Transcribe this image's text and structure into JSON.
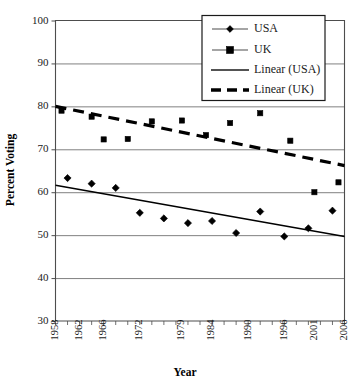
{
  "chart_data": {
    "type": "scatter",
    "title": "",
    "xlabel": "Year",
    "ylabel": "Percent Voting",
    "xlim": [
      1958,
      2006
    ],
    "ylim": [
      30,
      100
    ],
    "ytick_labels": [
      "30",
      "40",
      "50",
      "60",
      "70",
      "80",
      "90",
      "100"
    ],
    "ytick_values": [
      30,
      40,
      50,
      60,
      70,
      80,
      90,
      100
    ],
    "xtick_labels": [
      "1958",
      "1962",
      "1966",
      "1972",
      "1979",
      "1984",
      "1990",
      "1996",
      "2001",
      "2006"
    ],
    "xtick_values": [
      1958,
      1962,
      1966,
      1972,
      1979,
      1984,
      1990,
      1996,
      2001,
      2006
    ],
    "grid": "horizontal",
    "legend_position": "top-right",
    "series": [
      {
        "name": "USA",
        "marker": "diamond",
        "color": "#000000",
        "x": [
          1960,
          1964,
          1968,
          1972,
          1976,
          1980,
          1984,
          1988,
          1992,
          1996,
          2000,
          2004
        ],
        "values": [
          63.3,
          62.0,
          61.0,
          55.2,
          53.9,
          52.8,
          53.3,
          50.5,
          55.5,
          49.7,
          51.6,
          55.7
        ]
      },
      {
        "name": "UK",
        "marker": "square",
        "color": "#000000",
        "x": [
          1959,
          1964,
          1966,
          1970,
          1974,
          1979,
          1983,
          1987,
          1992,
          1997,
          2001,
          2005
        ],
        "values": [
          79.0,
          77.6,
          72.3,
          72.4,
          76.5,
          76.7,
          73.3,
          76.1,
          78.4,
          72.0,
          60.0,
          62.3
        ]
      },
      {
        "name": "Linear (USA)",
        "marker": "none",
        "line": "solid",
        "color": "#000000",
        "x": [
          1958,
          2006
        ],
        "values": [
          61.6,
          49.7
        ]
      },
      {
        "name": "Linear (UK)",
        "marker": "none",
        "line": "dashed",
        "color": "#000000",
        "x": [
          1958,
          2006
        ],
        "values": [
          80.0,
          66.2
        ]
      }
    ]
  },
  "legend": {
    "items": [
      {
        "label": "USA",
        "style": "line-diamond"
      },
      {
        "label": "UK",
        "style": "line-square"
      },
      {
        "label": "Linear (USA)",
        "style": "line-solid"
      },
      {
        "label": "Linear (UK)",
        "style": "line-dashed"
      }
    ]
  }
}
